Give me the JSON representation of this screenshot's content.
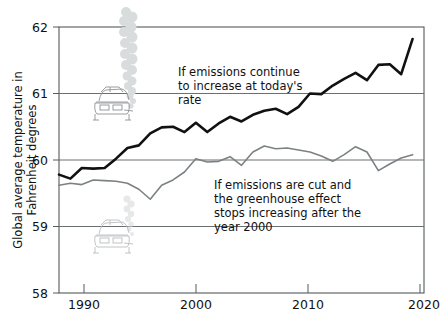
{
  "chart_data": {
    "type": "line",
    "title": "",
    "subtitle": "",
    "xlabel": "",
    "ylabel": "Global average temperature in Fahrenheit degrees",
    "ylabel_lines": [
      "Global average temperature in",
      "Fahrenheit degrees"
    ],
    "xlim": [
      1988,
      2020
    ],
    "ylim": [
      58,
      62
    ],
    "yticks": [
      58,
      59,
      60,
      61,
      62
    ],
    "ytick_labels": [
      "58",
      "59",
      "60",
      "61",
      "62"
    ],
    "xticks": [
      1990,
      2000,
      2010,
      2020
    ],
    "xtick_labels": [
      "1990",
      "2000",
      "2010",
      "2020"
    ],
    "grid": "horizontal gridlines at 59, 60, 61",
    "legend": "none (inline annotations)",
    "legend_position": "inline",
    "series": [
      {
        "name": "If emissions continue to increase at today's rate",
        "color": "#111111",
        "x": [
          1988,
          1989,
          1990,
          1991,
          1992,
          1993,
          1994,
          1995,
          1996,
          1997,
          1998,
          1999,
          2000,
          2001,
          2002,
          2003,
          2004,
          2005,
          2006,
          2007,
          2008,
          2009,
          2010,
          2011,
          2012,
          2013,
          2014,
          2015,
          2016,
          2017,
          2018,
          2019
        ],
        "values": [
          59.78,
          59.72,
          59.88,
          59.87,
          59.88,
          60.02,
          60.18,
          60.22,
          60.4,
          60.49,
          60.5,
          60.42,
          60.56,
          60.42,
          60.55,
          60.65,
          60.58,
          60.68,
          60.74,
          60.77,
          60.69,
          60.8,
          61.0,
          60.99,
          61.12,
          61.22,
          61.31,
          61.2,
          61.43,
          61.44,
          61.29,
          61.82
        ]
      },
      {
        "name": "If emissions are cut and the greenhouse effect stops increasing after the year 2000",
        "color": "#7c8183",
        "x": [
          1988,
          1989,
          1990,
          1991,
          1992,
          1993,
          1994,
          1995,
          1996,
          1997,
          1998,
          1999,
          2000,
          2001,
          2002,
          2003,
          2004,
          2005,
          2006,
          2007,
          2008,
          2009,
          2010,
          2011,
          2012,
          2013,
          2014,
          2015,
          2016,
          2017,
          2018,
          2019
        ],
        "values": [
          59.62,
          59.65,
          59.63,
          59.7,
          59.69,
          59.68,
          59.65,
          59.56,
          59.41,
          59.62,
          59.7,
          59.82,
          60.02,
          59.97,
          59.98,
          60.05,
          59.92,
          60.12,
          60.21,
          60.17,
          60.18,
          60.15,
          60.12,
          60.06,
          59.98,
          60.08,
          60.2,
          60.12,
          59.84,
          59.94,
          60.03,
          60.08
        ]
      }
    ],
    "annotations": [
      {
        "name": "high-emissions-annotation",
        "lines": [
          "If emissions continue",
          "to increase at today's",
          "rate"
        ]
      },
      {
        "name": "low-emissions-annotation",
        "lines": [
          "If emissions are cut and",
          "the greenhouse effect",
          "stops increasing after the",
          "year 2000"
        ]
      }
    ],
    "icons": [
      {
        "name": "car-with-exhaust-plume-large",
        "description": "car emitting a tall exhaust plume",
        "position": "upper-left, on the 61 degree gridline"
      },
      {
        "name": "car-with-exhaust-plume-small",
        "description": "faded car emitting a short exhaust plume",
        "position": "lower-left, on the 59 degree gridline"
      }
    ],
    "colors": {
      "high_series": "#111111",
      "low_series": "#7c8183",
      "grid": "#6a6f71",
      "frame": "#555a5c",
      "background": "#ffffff",
      "text": "#111111"
    }
  }
}
